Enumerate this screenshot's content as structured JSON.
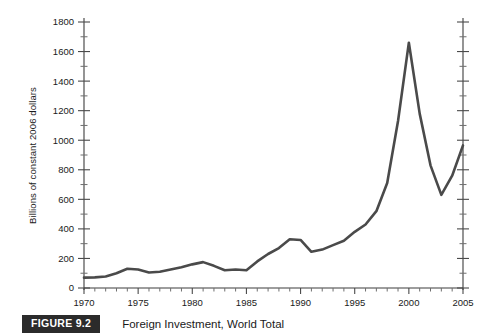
{
  "figure": {
    "badge_label": "FIGURE 9.2",
    "caption": "Foreign Investment, World Total"
  },
  "axes": {
    "y_axis_title": "Billions of constant 2006 dollars",
    "y_tick_labels": [
      "1800",
      "1600",
      "1400",
      "1200",
      "1000",
      "800",
      "600",
      "400",
      "200",
      "0"
    ],
    "x_tick_labels": [
      "1970",
      "1975",
      "1980",
      "1985",
      "1990",
      "1995",
      "2000",
      "2005"
    ]
  },
  "colors": {
    "line": "#4a4a4a",
    "axis": "#3d3d3d",
    "badge_background": "#2b2b2b",
    "badge_text": "#ffffff",
    "page_background": "#ffffff"
  },
  "chart_data": {
    "type": "line",
    "title": "Foreign Investment, World Total",
    "xlabel": "",
    "ylabel": "Billions of constant 2006 dollars",
    "xlim": [
      1970,
      2005
    ],
    "ylim": [
      0,
      1800
    ],
    "ytick_step": 200,
    "yminor_step": 100,
    "xtick_step": 5,
    "xminor_step": 1,
    "grid": false,
    "legend": "none",
    "x": [
      1970,
      1971,
      1972,
      1973,
      1974,
      1975,
      1976,
      1977,
      1978,
      1979,
      1980,
      1981,
      1982,
      1983,
      1984,
      1985,
      1986,
      1987,
      1988,
      1989,
      1990,
      1991,
      1992,
      1993,
      1994,
      1995,
      1996,
      1997,
      1998,
      1999,
      2000,
      2001,
      2002,
      2003,
      2004,
      2005
    ],
    "values": [
      70,
      72,
      78,
      100,
      130,
      125,
      105,
      110,
      125,
      140,
      160,
      175,
      150,
      120,
      125,
      120,
      180,
      230,
      270,
      330,
      325,
      245,
      260,
      290,
      320,
      380,
      430,
      520,
      710,
      1130,
      1660,
      1180,
      830,
      630,
      760,
      965
    ],
    "series": [
      {
        "name": "Foreign Investment, World Total",
        "values": [
          70,
          72,
          78,
          100,
          130,
          125,
          105,
          110,
          125,
          140,
          160,
          175,
          150,
          120,
          125,
          120,
          180,
          230,
          270,
          330,
          325,
          245,
          260,
          290,
          320,
          380,
          430,
          520,
          710,
          1130,
          1660,
          1180,
          830,
          630,
          760,
          965
        ]
      }
    ],
    "annotations": []
  }
}
